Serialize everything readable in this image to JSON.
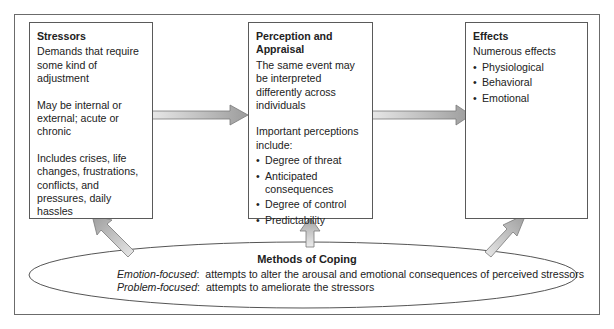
{
  "diagram": {
    "type": "flow",
    "stressors": {
      "title": "Stressors",
      "paragraphs": [
        "Demands that require some kind of adjustment",
        "May be internal or external; acute or chronic",
        "Includes crises, life changes, frustrations, conflicts, and pressures, daily hassles"
      ]
    },
    "perception": {
      "title": "Perception and Appraisal",
      "intro": "The same event may be interpreted differently across individuals",
      "list_heading": "Important perceptions include:",
      "items": [
        "Degree of threat",
        "Anticipated consequences",
        "Degree of control",
        "Predictability"
      ]
    },
    "effects": {
      "title": "Effects",
      "intro": "Numerous effects",
      "items": [
        "Physiological",
        "Behavioral",
        "Emotional"
      ]
    },
    "coping": {
      "title": "Methods of Coping",
      "lines": [
        {
          "label": "Emotion-focused",
          "text": ":  attempts to alter the arousal and emotional consequences of perceived stressors"
        },
        {
          "label": "Problem-focused",
          "text": ":  attempts to ameliorate the stressors"
        }
      ]
    },
    "arrows": [
      {
        "from": "Stressors",
        "to": "Perception and Appraisal"
      },
      {
        "from": "Perception and Appraisal",
        "to": "Effects"
      },
      {
        "from": "Methods of Coping",
        "to": "Stressors"
      },
      {
        "from": "Methods of Coping",
        "to": "Perception and Appraisal"
      },
      {
        "from": "Methods of Coping",
        "to": "Effects"
      }
    ],
    "colors": {
      "border": "#5a5a5a",
      "arrow_light": "#e6e6e6",
      "arrow_dark": "#9a9a9a",
      "arrow_stroke": "#7a7a7a"
    }
  }
}
